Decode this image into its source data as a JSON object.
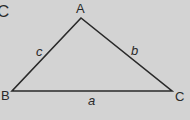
{
  "diagram": {
    "corner_label": "C",
    "vertices": {
      "A": {
        "label": "A",
        "x": 81,
        "y": 18
      },
      "B": {
        "label": "B",
        "x": 12,
        "y": 91
      },
      "C": {
        "label": "C",
        "x": 172,
        "y": 91
      }
    },
    "sides": {
      "a": {
        "label": "a",
        "between": [
          "B",
          "C"
        ]
      },
      "b": {
        "label": "b",
        "between": [
          "A",
          "C"
        ]
      },
      "c": {
        "label": "c",
        "between": [
          "A",
          "B"
        ]
      }
    },
    "colors": {
      "background": "#d3d3d3",
      "line": "#2a2a2a"
    }
  }
}
